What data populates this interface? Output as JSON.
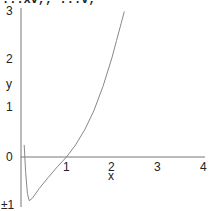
{
  "title_fragment": "...xv,, ...v,",
  "chart_data": {
    "type": "line",
    "title": "",
    "xlabel": "x",
    "ylabel": "y",
    "xlim": [
      0,
      4
    ],
    "ylim": [
      -1,
      3
    ],
    "x_ticks": [
      "1",
      "2",
      "3",
      "4"
    ],
    "y_ticks": [
      "±1",
      "0",
      "1",
      "2",
      "3"
    ],
    "grid": false,
    "series": [
      {
        "name": "curve",
        "color": "#888888",
        "x": [
          0.07,
          0.1,
          0.14,
          0.18,
          0.25,
          0.4,
          0.6,
          0.8,
          1.0,
          1.2,
          1.4,
          1.6,
          1.8,
          2.0,
          2.1,
          2.2,
          2.27
        ],
        "y": [
          0.25,
          -0.3,
          -0.75,
          -0.9,
          -0.85,
          -0.65,
          -0.42,
          -0.2,
          0.0,
          0.25,
          0.56,
          0.95,
          1.45,
          2.05,
          2.4,
          2.75,
          3.0
        ]
      }
    ]
  }
}
